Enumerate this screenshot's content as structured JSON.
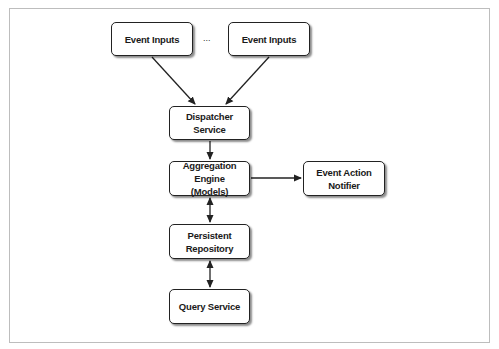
{
  "diagram": {
    "nodes": [
      {
        "id": "event-inputs-1",
        "label": "Event Inputs"
      },
      {
        "id": "event-inputs-2",
        "label": "Event Inputs"
      },
      {
        "id": "dispatcher-service",
        "label": "Dispatcher Service"
      },
      {
        "id": "aggregation-engine",
        "label": "Aggregation Engine\n(Models)"
      },
      {
        "id": "event-action-notifier",
        "label": "Event Action\nNotifier"
      },
      {
        "id": "persistent-repository",
        "label": "Persistent Repository"
      },
      {
        "id": "query-service",
        "label": "Query Service"
      }
    ],
    "ellipsis": "...",
    "edges": [
      {
        "from": "event-inputs-1",
        "to": "dispatcher-service",
        "direction": "forward"
      },
      {
        "from": "event-inputs-2",
        "to": "dispatcher-service",
        "direction": "forward"
      },
      {
        "from": "dispatcher-service",
        "to": "aggregation-engine",
        "direction": "forward"
      },
      {
        "from": "aggregation-engine",
        "to": "event-action-notifier",
        "direction": "forward"
      },
      {
        "from": "aggregation-engine",
        "to": "persistent-repository",
        "direction": "both"
      },
      {
        "from": "persistent-repository",
        "to": "query-service",
        "direction": "both"
      }
    ]
  },
  "colors": {
    "line": "#222222",
    "frame": "#bdbdbd",
    "background": "#ffffff"
  }
}
